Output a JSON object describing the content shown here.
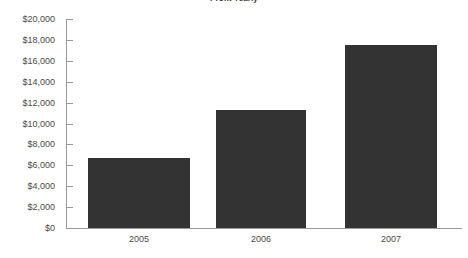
{
  "chart_data": {
    "type": "bar",
    "title": "Profit Yearly",
    "xlabel": "",
    "ylabel": "",
    "categories": [
      "2005",
      "2006",
      "2007"
    ],
    "values": [
      6700,
      11300,
      17500
    ],
    "ylim": [
      0,
      20000
    ],
    "ytick_values": [
      0,
      2000,
      4000,
      6000,
      8000,
      10000,
      12000,
      14000,
      16000,
      18000,
      20000
    ],
    "ytick_labels": [
      "$0",
      "$2,000",
      "$4,000",
      "$6,000",
      "$8,000",
      "$10,000",
      "$12,000",
      "$14,000",
      "$16,000",
      "$18,000",
      "$20,000"
    ],
    "grid": false,
    "legend": false,
    "bar_color": "#333333",
    "axis_color": "#9a9a9a",
    "label_color": "#4a4a4a"
  }
}
